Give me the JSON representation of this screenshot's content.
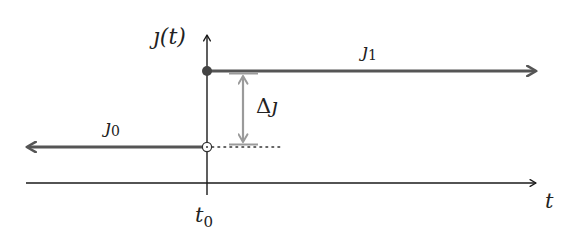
{
  "diagram": {
    "type": "step-function",
    "colors": {
      "axis": "#1a1a1a",
      "level_line": "#555555",
      "delta_arrow": "#9a9a9a",
      "dot_filled": "#444444"
    },
    "labels": {
      "y_axis": "𝚥(t)",
      "x_axis": "t",
      "t0": "t",
      "t0_sub": "0",
      "j0": "𝚥",
      "j0_sub": "0",
      "j1": "𝚥",
      "j1_sub": "1",
      "delta": "Δ𝚥"
    }
  }
}
